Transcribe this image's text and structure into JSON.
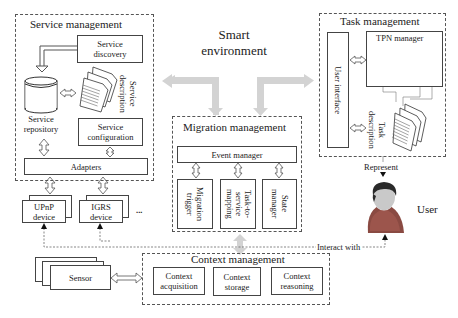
{
  "diagram": {
    "center_label": [
      "Smart",
      "environment"
    ],
    "service_management": {
      "title": "Service management",
      "service_discovery": [
        "Service",
        "discovery"
      ],
      "service_description": [
        "Service",
        "description"
      ],
      "service_repository": [
        "Service",
        "repository"
      ],
      "service_configuration": [
        "Service",
        "configuration"
      ],
      "adapters": "Adapters"
    },
    "devices": [
      {
        "line1": "UPnP",
        "line2": "device"
      },
      {
        "line1": "IGRS",
        "line2": "device"
      }
    ],
    "devices_more": "...",
    "migration_management": {
      "title": "Migration management",
      "event_manager": "Event manager",
      "components": [
        [
          "Migration",
          "trigger"
        ],
        [
          "Task-to-",
          "service",
          "mapping"
        ],
        [
          "State",
          "manager"
        ]
      ]
    },
    "task_management": {
      "title": "Task management",
      "user_interface": "User interface",
      "tpn_manager": "TPN manager",
      "task_description": [
        "Task",
        "description"
      ]
    },
    "context_management": {
      "title": "Context management",
      "components": [
        [
          "Context",
          "acquisition"
        ],
        [
          "Context",
          "storage"
        ],
        [
          "Context",
          "reasoning"
        ]
      ]
    },
    "sensor": "Sensor",
    "user": "User",
    "represent_label": "Represent",
    "interact_label": "Interact with",
    "colors": {
      "border": "#444444",
      "big_arrow": "#cfcfcf",
      "tpn_left_node": "#b5b5b5",
      "tpn_right_node": "#6e6e6e",
      "user_shirt": "#8a4a42"
    }
  }
}
